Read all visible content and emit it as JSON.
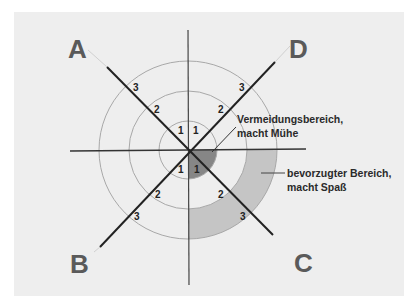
{
  "diagram": {
    "center": {
      "x": 188,
      "y": 150
    },
    "rings": [
      {
        "level": "1",
        "radius": 29
      },
      {
        "level": "2",
        "radius": 59
      },
      {
        "level": "3",
        "radius": 89
      }
    ],
    "quadrants": {
      "A": "A",
      "B": "B",
      "C": "C",
      "D": "D"
    },
    "ring_labels": {
      "a1": "1",
      "a2": "2",
      "a3": "3",
      "d1": "1",
      "d2": "2",
      "d3": "3",
      "b1": "1",
      "b2": "2",
      "b3": "3",
      "c1": "1",
      "c2": "2",
      "c3": "3"
    },
    "annotations": {
      "avoidance_line1": "Vermeidungsbereich,",
      "avoidance_line2": "macht Mühe",
      "preferred_line1": "bevorzugter Bereich,",
      "preferred_line2": "macht Spaß"
    },
    "colors": {
      "background": "#eeeeee",
      "ring": "#a8a8a8",
      "axis": "#333333",
      "avoidance_zone": "#7a7a7a",
      "preferred_zone": "#bdbdbd",
      "letter": "#5a5a5a"
    }
  }
}
